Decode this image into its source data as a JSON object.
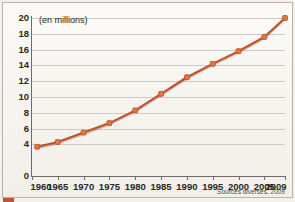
{
  "chart_data": {
    "type": "line",
    "title": "",
    "unit_note": "(en millions)",
    "source_note": "Sources diverses, 2009",
    "xlabel": "",
    "ylabel": "",
    "xlim": [
      1960,
      2009
    ],
    "ylim": [
      0,
      20
    ],
    "ytick_step": 2,
    "yticks": [
      20,
      18,
      16,
      14,
      12,
      10,
      8,
      6,
      4,
      0
    ],
    "ytick_labels": [
      "20",
      "18",
      "16",
      "14",
      "12",
      "10",
      "8",
      "6",
      "4",
      "0"
    ],
    "xticks": [
      1960,
      1965,
      1970,
      1975,
      1980,
      1985,
      1990,
      1995,
      2000,
      2005,
      2009
    ],
    "xtick_labels": [
      "1960",
      "1965",
      "1970",
      "1975",
      "1980",
      "1985",
      "1990",
      "1995",
      "2000",
      "2005",
      "2009"
    ],
    "grid": "horizontal",
    "legend": "none",
    "series": [
      {
        "name": "Population (en millions)",
        "color": "#c4502a",
        "marker": "square",
        "x": [
          1961,
          1965,
          1970,
          1975,
          1980,
          1985,
          1990,
          1995,
          2000,
          2005,
          2009
        ],
        "values": [
          3.7,
          4.3,
          5.5,
          6.7,
          8.3,
          10.4,
          12.5,
          14.2,
          15.8,
          17.6,
          20.0
        ]
      }
    ]
  },
  "colors": {
    "series": "#c4502a",
    "marker": "#e07a3c",
    "grid": "#cfcbc4",
    "axis": "#6e6a64",
    "background": "#f7f5f1",
    "text": "#2a2724"
  }
}
